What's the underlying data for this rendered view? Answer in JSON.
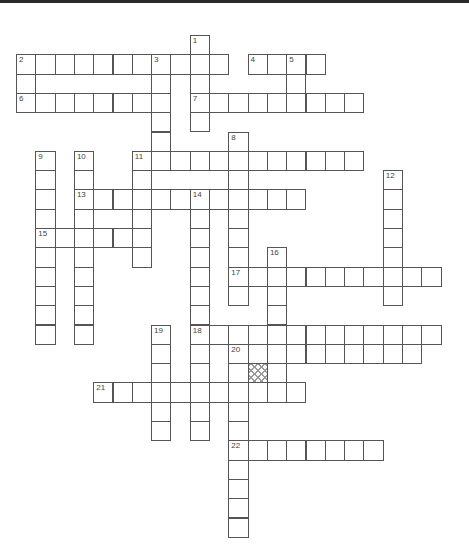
{
  "puzzle": {
    "type": "crossword",
    "cell_size": 19.3,
    "origin": [
      16,
      35
    ],
    "colors": {
      "border": "#555555",
      "background": "#ffffff",
      "hatch": "#9a9a9a",
      "topbar": "#2a2a2a"
    },
    "entries": [
      {
        "num": "1",
        "dir": "down",
        "col": 9,
        "row": 0,
        "len": 5
      },
      {
        "num": "2",
        "dir": "across",
        "col": 0,
        "row": 1,
        "len": 11
      },
      {
        "num": "2",
        "dir": "down",
        "col": 0,
        "row": 1,
        "len": 3
      },
      {
        "num": "3",
        "dir": "down",
        "col": 7,
        "row": 1,
        "len": 6
      },
      {
        "num": "4",
        "dir": "across",
        "col": 12,
        "row": 1,
        "len": 4
      },
      {
        "num": "5",
        "dir": "down",
        "col": 14,
        "row": 1,
        "len": 3
      },
      {
        "num": "6",
        "dir": "across",
        "col": 0,
        "row": 3,
        "len": 8
      },
      {
        "num": "7",
        "dir": "across",
        "col": 9,
        "row": 3,
        "len": 9
      },
      {
        "num": "8",
        "dir": "down",
        "col": 11,
        "row": 5,
        "len": 9
      },
      {
        "num": "9",
        "dir": "down",
        "col": 1,
        "row": 6,
        "len": 10
      },
      {
        "num": "10",
        "dir": "down",
        "col": 3,
        "row": 6,
        "len": 10
      },
      {
        "num": "11",
        "dir": "across",
        "col": 6,
        "row": 6,
        "len": 12
      },
      {
        "num": "11",
        "dir": "down",
        "col": 6,
        "row": 6,
        "len": 6
      },
      {
        "num": "12",
        "dir": "down",
        "col": 19,
        "row": 7,
        "len": 7
      },
      {
        "num": "13",
        "dir": "across",
        "col": 3,
        "row": 8,
        "len": 12
      },
      {
        "num": "14",
        "dir": "down",
        "col": 9,
        "row": 8,
        "len": 13
      },
      {
        "num": "15",
        "dir": "across",
        "col": 1,
        "row": 10,
        "len": 6
      },
      {
        "num": "16",
        "dir": "down",
        "col": 13,
        "row": 11,
        "len": 8
      },
      {
        "num": "17",
        "dir": "across",
        "col": 11,
        "row": 12,
        "len": 11
      },
      {
        "num": "18",
        "dir": "across",
        "col": 9,
        "row": 15,
        "len": 13
      },
      {
        "num": "19",
        "dir": "down",
        "col": 7,
        "row": 15,
        "len": 6
      },
      {
        "num": "20",
        "dir": "across",
        "col": 11,
        "row": 16,
        "len": 10
      },
      {
        "num": "20",
        "dir": "down",
        "col": 11,
        "row": 16,
        "len": 10
      },
      {
        "num": "21",
        "dir": "across",
        "col": 4,
        "row": 18,
        "len": 11
      },
      {
        "num": "22",
        "dir": "across",
        "col": 11,
        "row": 21,
        "len": 8
      }
    ],
    "hatched_cells": [
      [
        12,
        17
      ]
    ]
  }
}
